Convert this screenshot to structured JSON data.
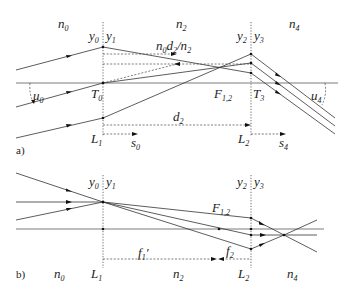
{
  "panels": [
    {
      "id": "a",
      "label": "a)",
      "media": [
        {
          "n": "n",
          "sub": "0"
        },
        {
          "n": "n",
          "sub": "2"
        },
        {
          "n": "n",
          "sub": "4"
        }
      ],
      "planes": {
        "y0": {
          "v": "y",
          "sub": "0"
        },
        "y1": {
          "v": "y",
          "sub": "1"
        },
        "y2": {
          "v": "y",
          "sub": "2"
        },
        "y3": {
          "v": "y",
          "sub": "3"
        }
      },
      "points": {
        "T0": {
          "v": "T",
          "sub": "0"
        },
        "T3": {
          "v": "T",
          "sub": "3"
        },
        "F12": {
          "v": "F",
          "sub": "1,2"
        }
      },
      "lenses": {
        "L1": {
          "v": "L",
          "sub": "1"
        },
        "L2": {
          "v": "L",
          "sub": "2"
        }
      },
      "distances": {
        "d2": {
          "v": "d",
          "sub": "2"
        },
        "s0": {
          "v": "s",
          "sub": "0"
        },
        "s4": {
          "v": "s",
          "sub": "4"
        },
        "reduced": {
          "p1": "n",
          "s1": "0",
          "p2": "d",
          "s2": "2",
          "p3": "/n",
          "s3": "2"
        }
      },
      "angles": {
        "u0": {
          "v": "u",
          "sub": "0"
        },
        "u4": {
          "v": "u",
          "sub": "4"
        }
      }
    },
    {
      "id": "b",
      "label": "b)",
      "media": [
        {
          "n": "n",
          "sub": "0"
        },
        {
          "n": "n",
          "sub": "2"
        },
        {
          "n": "n",
          "sub": "4"
        }
      ],
      "planes": {
        "y0": {
          "v": "y",
          "sub": "0"
        },
        "y1": {
          "v": "y",
          "sub": "1"
        },
        "y2": {
          "v": "y",
          "sub": "2"
        },
        "y3": {
          "v": "y",
          "sub": "3"
        }
      },
      "points": {
        "F12": {
          "v": "F",
          "sub": "1,2"
        }
      },
      "lenses": {
        "L1": {
          "v": "L",
          "sub": "1"
        },
        "L2": {
          "v": "L",
          "sub": "2"
        }
      },
      "distances": {
        "f1p": {
          "v": "f",
          "sub": "1",
          "prime": "′"
        },
        "f2": {
          "v": "f",
          "sub": "2"
        }
      }
    }
  ]
}
